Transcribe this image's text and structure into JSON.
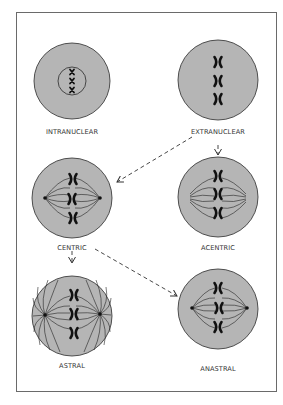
{
  "diagram": {
    "colors": {
      "cell_fill": "#b5b5b5",
      "cell_stroke": "#2a2a2a",
      "chromosome": "#111111",
      "frame": "#6a6a6a",
      "arrow": "#333333",
      "background": "#ffffff"
    },
    "nodes": [
      {
        "id": "intranuclear",
        "label": "INTRANUCLEAR",
        "type": "cell-with-nucleus",
        "chromosomes": 3
      },
      {
        "id": "extranuclear",
        "label": "EXTRANUCLEAR",
        "type": "cell-chromosomes",
        "chromosomes": 3
      },
      {
        "id": "centric",
        "label": "CENTRIC",
        "type": "spindle-with-centrioles",
        "chromosomes": 3
      },
      {
        "id": "acentric",
        "label": "ACENTRIC",
        "type": "spindle-no-centrioles",
        "chromosomes": 3
      },
      {
        "id": "astral",
        "label": "ASTRAL",
        "type": "spindle-with-asters",
        "chromosomes": 3
      },
      {
        "id": "anastral",
        "label": "ANASTRAL",
        "type": "spindle-centrioles-no-asters",
        "chromosomes": 3
      }
    ],
    "edges": [
      {
        "from": "extranuclear",
        "to": "centric",
        "style": "dashed"
      },
      {
        "from": "extranuclear",
        "to": "acentric",
        "style": "dashed"
      },
      {
        "from": "centric",
        "to": "astral",
        "style": "dashed"
      },
      {
        "from": "centric",
        "to": "anastral",
        "style": "dashed"
      }
    ]
  }
}
